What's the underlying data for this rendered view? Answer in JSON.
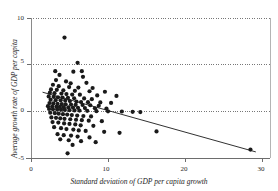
{
  "chart_data": {
    "type": "scatter",
    "title": "",
    "xlabel": "Standard deviation of GDP per capita growth",
    "ylabel": "Average growth rate of GDP per capita",
    "xlim": [
      0,
      31.5
    ],
    "ylim": [
      -5.8,
      10.6
    ],
    "xticks": [
      0,
      10,
      20,
      30
    ],
    "xtick_labels": [
      "0",
      "10",
      "20",
      "30"
    ],
    "yticks": [
      -5,
      0,
      5,
      10
    ],
    "ytick_labels": [
      "-5",
      "0",
      "5",
      "10"
    ],
    "grid": "dotted horizontal gridlines at y = -5, 0, 5, 10",
    "legend": "none",
    "marker": {
      "shape": "circle",
      "color": "#1a1a1a",
      "size": 2.1
    },
    "trendline": {
      "name": "fitted regression line",
      "color": "#1a1a1a",
      "x_start": 1.5,
      "y_start": 2.05,
      "x_end": 29.2,
      "y_end": -4.35
    },
    "points": [
      [
        4.35,
        7.9
      ],
      [
        6.05,
        5.2
      ],
      [
        3.15,
        4.3
      ],
      [
        3.7,
        3.9
      ],
      [
        5.5,
        4.25
      ],
      [
        6.6,
        4.3
      ],
      [
        6.75,
        3.7
      ],
      [
        3.25,
        3.35
      ],
      [
        4.55,
        3.2
      ],
      [
        5.15,
        3.0
      ],
      [
        7.2,
        3.05
      ],
      [
        2.85,
        2.85
      ],
      [
        3.6,
        2.7
      ],
      [
        4.95,
        2.6
      ],
      [
        6.15,
        2.55
      ],
      [
        8.0,
        2.5
      ],
      [
        2.6,
        2.35
      ],
      [
        3.35,
        2.3
      ],
      [
        4.2,
        2.25
      ],
      [
        5.7,
        2.2
      ],
      [
        7.6,
        2.15
      ],
      [
        9.6,
        2.1
      ],
      [
        2.45,
        2.0
      ],
      [
        3.05,
        1.95
      ],
      [
        3.95,
        1.9
      ],
      [
        4.6,
        1.85
      ],
      [
        5.35,
        1.8
      ],
      [
        6.35,
        1.78
      ],
      [
        8.6,
        1.7
      ],
      [
        11.1,
        1.65
      ],
      [
        2.3,
        1.6
      ],
      [
        2.95,
        1.55
      ],
      [
        3.5,
        1.5
      ],
      [
        4.1,
        1.48
      ],
      [
        4.8,
        1.45
      ],
      [
        5.6,
        1.4
      ],
      [
        6.9,
        1.38
      ],
      [
        7.9,
        1.3
      ],
      [
        2.55,
        1.25
      ],
      [
        3.2,
        1.2
      ],
      [
        3.85,
        1.18
      ],
      [
        4.45,
        1.15
      ],
      [
        5.05,
        1.1
      ],
      [
        5.9,
        1.05
      ],
      [
        6.5,
        1.0
      ],
      [
        7.4,
        0.98
      ],
      [
        9.0,
        0.95
      ],
      [
        10.4,
        0.9
      ],
      [
        2.4,
        0.88
      ],
      [
        2.9,
        0.85
      ],
      [
        3.45,
        0.8
      ],
      [
        4.0,
        0.78
      ],
      [
        4.5,
        0.75
      ],
      [
        5.2,
        0.72
      ],
      [
        5.8,
        0.7
      ],
      [
        6.7,
        0.68
      ],
      [
        7.7,
        0.65
      ],
      [
        8.8,
        0.6
      ],
      [
        2.2,
        0.55
      ],
      [
        2.75,
        0.52
      ],
      [
        3.3,
        0.5
      ],
      [
        3.75,
        0.48
      ],
      [
        4.25,
        0.45
      ],
      [
        4.85,
        0.42
      ],
      [
        5.45,
        0.4
      ],
      [
        6.1,
        0.38
      ],
      [
        7.0,
        0.35
      ],
      [
        8.3,
        0.32
      ],
      [
        9.8,
        0.3
      ],
      [
        2.35,
        0.25
      ],
      [
        2.85,
        0.22
      ],
      [
        3.4,
        0.2
      ],
      [
        3.9,
        0.18
      ],
      [
        4.4,
        0.15
      ],
      [
        5.0,
        0.12
      ],
      [
        5.65,
        0.1
      ],
      [
        6.3,
        0.08
      ],
      [
        7.3,
        0.05
      ],
      [
        8.5,
        0.02
      ],
      [
        10.0,
        0.0
      ],
      [
        11.8,
        -0.02
      ],
      [
        13.2,
        -0.05
      ],
      [
        14.2,
        -0.08
      ],
      [
        2.5,
        -0.15
      ],
      [
        3.1,
        -0.2
      ],
      [
        3.6,
        -0.25
      ],
      [
        4.15,
        -0.3
      ],
      [
        4.7,
        -0.35
      ],
      [
        5.3,
        -0.4
      ],
      [
        6.0,
        -0.45
      ],
      [
        6.8,
        -0.5
      ],
      [
        7.8,
        -0.55
      ],
      [
        2.65,
        -0.65
      ],
      [
        3.25,
        -0.7
      ],
      [
        3.8,
        -0.75
      ],
      [
        4.35,
        -0.8
      ],
      [
        5.1,
        -0.85
      ],
      [
        5.85,
        -0.9
      ],
      [
        6.6,
        -0.95
      ],
      [
        7.5,
        -1.0
      ],
      [
        9.2,
        -1.05
      ],
      [
        2.8,
        -1.15
      ],
      [
        3.55,
        -1.2
      ],
      [
        4.3,
        -1.3
      ],
      [
        5.0,
        -1.35
      ],
      [
        5.75,
        -1.4
      ],
      [
        6.45,
        -1.5
      ],
      [
        8.1,
        -1.55
      ],
      [
        3.0,
        -1.7
      ],
      [
        3.9,
        -1.8
      ],
      [
        4.6,
        -1.9
      ],
      [
        5.5,
        -1.95
      ],
      [
        6.2,
        -2.05
      ],
      [
        7.1,
        -2.1
      ],
      [
        9.5,
        -2.2
      ],
      [
        11.5,
        -2.3
      ],
      [
        3.45,
        -2.45
      ],
      [
        4.25,
        -2.55
      ],
      [
        5.2,
        -2.6
      ],
      [
        6.05,
        -2.7
      ],
      [
        7.6,
        -2.8
      ],
      [
        3.8,
        -3.0
      ],
      [
        4.9,
        -3.1
      ],
      [
        6.5,
        -3.2
      ],
      [
        8.4,
        -3.3
      ],
      [
        5.4,
        -3.6
      ],
      [
        16.3,
        -2.15
      ],
      [
        4.75,
        -4.5
      ],
      [
        28.5,
        -4.1
      ]
    ]
  }
}
